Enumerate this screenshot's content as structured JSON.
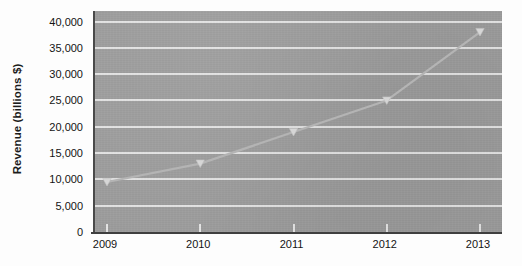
{
  "chart_data": {
    "type": "line",
    "title": "",
    "subtitle": "",
    "xlabel": "",
    "ylabel": "Revenue (billions $)",
    "categories": [
      "2009",
      "2010",
      "2011",
      "2012",
      "2013"
    ],
    "x": [
      2009,
      2010,
      2011,
      2012,
      2013
    ],
    "series": [
      {
        "name": "Revenue",
        "values": [
          9500,
          13000,
          19000,
          25000,
          38000
        ],
        "marker": "triangle",
        "color": "#b4b4b4"
      }
    ],
    "ylim": [
      0,
      42000
    ],
    "xlim": [
      2008.8,
      2013.3
    ],
    "y_ticks": [
      0,
      5000,
      10000,
      15000,
      20000,
      25000,
      30000,
      35000,
      40000
    ],
    "y_tick_labels": [
      "0",
      "5,000",
      "10,000",
      "15,000",
      "20,000",
      "25,000",
      "30,000",
      "35,000",
      "40,000"
    ],
    "x_tick_labels": [
      "2009",
      "2010",
      "2011",
      "2012",
      "2013"
    ],
    "grid": "horizontal",
    "legend": "none",
    "plot_background_color": "#9b9b9b",
    "gridline_color": "#e9e9e9",
    "axis_color": "#3f3f3f",
    "figure_background_color": "#fdfdfd"
  }
}
